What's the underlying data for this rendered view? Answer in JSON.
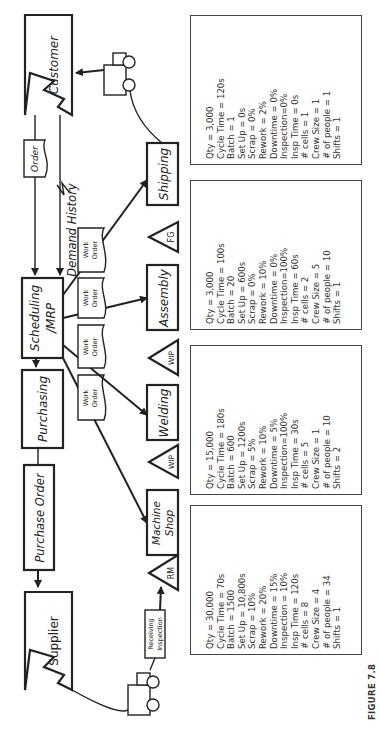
{
  "figure_label": "FIGURE 7.8",
  "entities": {
    "customer": "Customer",
    "supplier": "Supplier"
  },
  "control": {
    "scheduling_line1": "Scheduling",
    "scheduling_line2": "/MRP",
    "purchasing": "Purchasing",
    "purchase_order": "Purchase Order",
    "order": "Order",
    "demand_history": "Demand History",
    "work_order_line1": "Work",
    "work_order_line2": "Order"
  },
  "processes": {
    "machine_shop_line1": "Machine",
    "machine_shop_line2": "Shop",
    "welding": "Welding",
    "assembly": "Assembly",
    "shipping": "Shipping",
    "receiving_line1": "Receiving",
    "receiving_line2": "Inspection"
  },
  "inventory": {
    "rm": "RM",
    "wip1": "WIP",
    "wip2": "WIP",
    "fg": "FG"
  },
  "data_boxes": {
    "machine_shop": [
      "Qty = 30,000",
      "Cycle Time = 70s",
      "Batch = 1500",
      "Set Up = 10,800s",
      "Scrap = 10%",
      "Rework = 20%",
      "Downtime = 15%",
      "Inspection = 10%",
      "Insp Time = 120s",
      "# cells = 8",
      "Crew Size = 4",
      "# of people = 34",
      "Shifts = 1"
    ],
    "welding": [
      "Qty = 15,000",
      "Cycle Time = 180s",
      "Batch = 600",
      "Set Up = 1200s",
      "Scrap = 5%",
      "Rework = 10%",
      "Downtime = 5%",
      "Inspection=100%",
      "Insp Time = 30s",
      "# cells = 5",
      "Crew Size = 1",
      "# of people = 10",
      "Shifts = 2"
    ],
    "assembly": [
      "Qty = 3,000",
      "Cycle Time = 100s",
      "Batch = 20",
      "Set Up = 600s",
      "Scrap = 0%",
      "Rework = 10%",
      "Downtime = 0%",
      "Inspection=100%",
      "Insp Time = 60s",
      "# cells = 2",
      "Crew Size = 5",
      "# of people = 10",
      "Shifts = 1"
    ],
    "shipping": [
      "Qty = 3,000",
      "Cycle Time = 120s",
      "Batch = 1",
      "Set Up = 0s",
      "Scrap = 0%",
      "Rework = 2%",
      "Downtime = 0%",
      "Inspection=0%",
      "Insp Time = 0s",
      "# cells = 1",
      "Crew Size = 1",
      "# of people = 1",
      "Shifts = 1"
    ]
  }
}
